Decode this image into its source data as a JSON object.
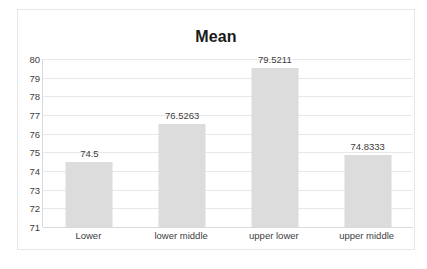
{
  "chart_data": {
    "type": "bar",
    "title": "Mean",
    "categories": [
      "Lower",
      "lower middle",
      "upper lower",
      "upper middle"
    ],
    "values": [
      74.5,
      76.5263,
      79.5211,
      74.8333
    ],
    "value_labels": [
      "74.5",
      "76.5263",
      "79.5211",
      "74.8333"
    ],
    "xlabel": "",
    "ylabel": "",
    "ylim": [
      71,
      80
    ],
    "y_ticks": [
      80,
      79,
      78,
      77,
      76,
      75,
      74,
      73,
      72,
      71
    ],
    "y_tick_labels": [
      "80",
      "79",
      "78",
      "77",
      "76",
      "75",
      "74",
      "73",
      "72",
      "71"
    ],
    "grid": true,
    "grid_axis": "y",
    "legend": false,
    "legend_position": "none",
    "series": [
      {
        "name": "Mean",
        "values": [
          74.5,
          76.5263,
          79.5211,
          74.8333
        ]
      }
    ],
    "colors": {
      "bar_fill": "#dcdcdc",
      "gridline": "#e8e8e8",
      "axis": "#d9d9d9",
      "text": "#3d3d3d",
      "title": "#1a1a1a",
      "frame_border": "#e6e6e6",
      "background": "#ffffff"
    }
  }
}
